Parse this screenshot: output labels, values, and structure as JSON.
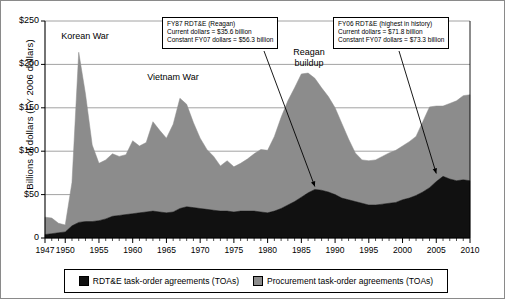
{
  "axis": {
    "ylabel": "Billions of dollars (FY 2006 dollars)",
    "yticks": [
      "$250",
      "$200",
      "$150",
      "$100",
      "$50",
      "0"
    ],
    "xticks": [
      "1947",
      "1950",
      "1955",
      "1960",
      "1965",
      "1970",
      "1975",
      "1980",
      "1985",
      "1990",
      "1995",
      "2000",
      "2005",
      "2010"
    ]
  },
  "labels": {
    "korean_war": "Korean War",
    "vietnam_war": "Vietnam War",
    "reagan_line1": "Reagan",
    "reagan_line2": "buildup"
  },
  "callouts": {
    "reagan": {
      "line1": "FY87 RDT&E (Reagan)",
      "line2": "Current dollars = $35.6 billion",
      "line3": "Constant FY07 dollars = $56.3 billion"
    },
    "fy06": {
      "line1": "FY06 RDT&E (highest in history)",
      "line2": "Current dollars = $71.8 billion",
      "line3": "Constant FY07 dollars = $73.3 billion"
    }
  },
  "legend": {
    "rdte": "RDT&E task-order agreements (TOAs)",
    "procurement": "Procurement task-order agreements (TOAs)"
  },
  "colors": {
    "rdte": "#111111",
    "procurement": "#8c8c8c",
    "grid": "#8a8a8a",
    "axis": "#000000"
  },
  "chart_data": {
    "type": "area",
    "stacked": true,
    "title": "",
    "xlabel": "",
    "ylabel": "Billions of dollars (FY 2006 dollars)",
    "ylim": [
      0,
      250
    ],
    "xlim": [
      1947,
      2010
    ],
    "grid": true,
    "legend_position": "bottom",
    "x": [
      1947,
      1948,
      1949,
      1950,
      1951,
      1952,
      1953,
      1954,
      1955,
      1956,
      1957,
      1958,
      1959,
      1960,
      1961,
      1962,
      1963,
      1964,
      1965,
      1966,
      1967,
      1968,
      1969,
      1970,
      1971,
      1972,
      1973,
      1974,
      1975,
      1976,
      1977,
      1978,
      1979,
      1980,
      1981,
      1982,
      1983,
      1984,
      1985,
      1986,
      1987,
      1988,
      1989,
      1990,
      1991,
      1992,
      1993,
      1994,
      1995,
      1996,
      1997,
      1998,
      1999,
      2000,
      2001,
      2002,
      2003,
      2004,
      2005,
      2006,
      2007,
      2008,
      2009,
      2010
    ],
    "series": [
      {
        "name": "RDT&E task-order agreements (TOAs)",
        "color": "#111111",
        "values": [
          4,
          5,
          6,
          7,
          14,
          18,
          19,
          19,
          20,
          22,
          25,
          26,
          27,
          28,
          29,
          30,
          31,
          30,
          29,
          30,
          34,
          36,
          35,
          34,
          33,
          32,
          31,
          31,
          30,
          31,
          31,
          31,
          30,
          29,
          31,
          34,
          38,
          42,
          47,
          52,
          56,
          55,
          53,
          50,
          46,
          44,
          42,
          40,
          38,
          38,
          39,
          40,
          41,
          44,
          46,
          49,
          53,
          58,
          65,
          71,
          68,
          66,
          67,
          66
        ]
      },
      {
        "name": "Procurement task-order agreements (TOAs)",
        "color": "#8c8c8c",
        "values": [
          20,
          18,
          11,
          8,
          50,
          196,
          147,
          88,
          66,
          68,
          72,
          68,
          69,
          84,
          77,
          80,
          103,
          94,
          86,
          101,
          127,
          118,
          98,
          81,
          69,
          62,
          52,
          58,
          52,
          55,
          60,
          66,
          72,
          72,
          86,
          105,
          120,
          131,
          142,
          138,
          128,
          118,
          110,
          100,
          86,
          70,
          56,
          50,
          51,
          52,
          55,
          58,
          60,
          62,
          65,
          68,
          81,
          93,
          87,
          81,
          87,
          92,
          97,
          99
        ]
      }
    ],
    "annotations": [
      {
        "text": "Korean War",
        "x": 1952,
        "y": 230
      },
      {
        "text": "Vietnam War",
        "x": 1964,
        "y": 178
      },
      {
        "text": "Reagan buildup",
        "x": 1986,
        "y": 205
      },
      {
        "text": "FY87 RDT&E (Reagan) arrow",
        "x": 1987,
        "y": 56.3
      },
      {
        "text": "FY06 RDT&E (highest in history) arrow",
        "x": 2005,
        "y": 71.8
      }
    ]
  }
}
